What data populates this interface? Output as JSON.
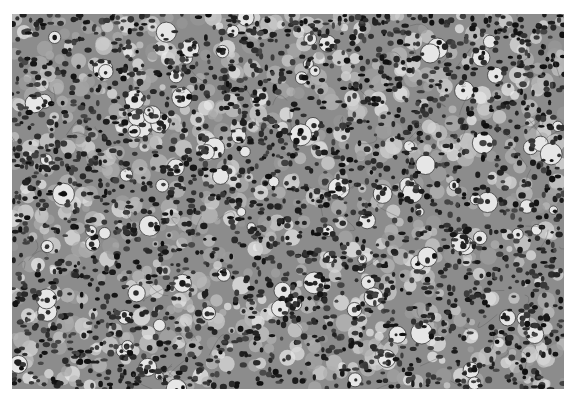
{
  "figure": {
    "type": "grayscale histology micrograph",
    "colors": {
      "background": "#ffffff",
      "stroma": "#8c8c8c",
      "nucleus": "#1e1e1e",
      "clear_cell": "#e6e6e6"
    },
    "caption": {
      "visible": true,
      "legible": false,
      "note": "caption text cropped at bottom edge; only tops of letters visible",
      "word_widths_px": [
        22,
        30,
        14,
        34,
        18,
        26,
        40,
        12,
        28,
        20,
        36,
        16,
        24,
        30,
        18,
        22,
        34,
        14,
        26,
        20,
        28,
        18
      ]
    }
  }
}
